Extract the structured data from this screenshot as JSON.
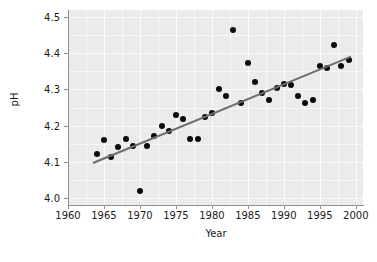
{
  "chart_data": {
    "type": "scatter",
    "title": "",
    "xlabel": "Year",
    "ylabel": "pH",
    "xlim": [
      1960,
      2001
    ],
    "ylim": [
      3.98,
      4.52
    ],
    "xticks": [
      1960,
      1965,
      1970,
      1975,
      1980,
      1985,
      1990,
      1995,
      2000
    ],
    "xticklabels": [
      "1960",
      "1965",
      "1970",
      "1975",
      "1980",
      "1985",
      "1990",
      "1995",
      "2000"
    ],
    "yticks": [
      4.0,
      4.1,
      4.2,
      4.3,
      4.4,
      4.5
    ],
    "yticklabels": [
      "4.0",
      "4.1",
      "4.2",
      "4.3",
      "4.4",
      "4.5"
    ],
    "grid": true,
    "legend": null,
    "panel_color": "#ebebeb",
    "grid_color": "#f7f7f7",
    "point_color": "#0a0a0a",
    "line_color": "#6e6e6e",
    "series": [
      {
        "name": "pH observations",
        "marker": "filled-circle",
        "x": [
          1964,
          1965,
          1966,
          1967,
          1968,
          1969,
          1970,
          1971,
          1972,
          1973,
          1974,
          1975,
          1976,
          1977,
          1978,
          1979,
          1980,
          1981,
          1982,
          1983,
          1984,
          1985,
          1986,
          1987,
          1988,
          1989,
          1990,
          1991,
          1992,
          1993,
          1994,
          1995,
          1996,
          1997,
          1998,
          1999
        ],
        "y": [
          4.12,
          4.16,
          4.112,
          4.142,
          4.164,
          4.143,
          4.02,
          4.143,
          4.17,
          4.2,
          4.186,
          4.23,
          4.218,
          4.162,
          4.162,
          4.225,
          4.235,
          4.3,
          4.282,
          4.465,
          4.262,
          4.372,
          4.32,
          4.29,
          4.272,
          4.305,
          4.315,
          4.313,
          4.283,
          4.263,
          4.27,
          4.365,
          4.36,
          4.422,
          4.364,
          4.382
        ]
      }
    ],
    "trendline": {
      "name": "linear fit",
      "x_start": 1963.5,
      "y_start": 4.1,
      "x_end": 1999.4,
      "y_end": 4.395
    }
  }
}
